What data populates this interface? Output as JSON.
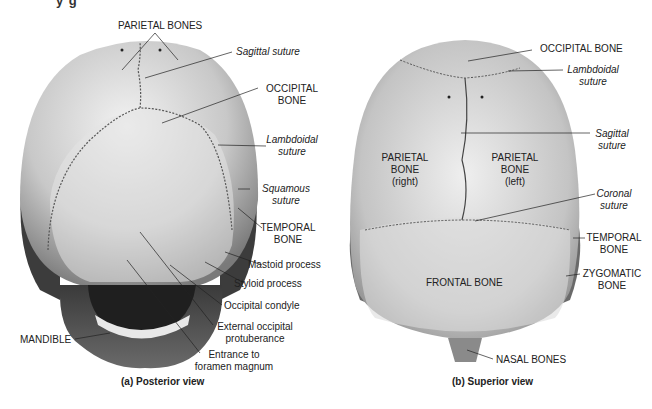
{
  "figure": {
    "clipped_heading": "y g",
    "colors": {
      "bone_light": "#ececec",
      "bone_mid": "#b4b4b4",
      "bone_dark": "#5a5a5a",
      "temporal_dark": "#3c3c3c",
      "suture": "#555555",
      "leader": "#222222"
    }
  },
  "posterior": {
    "caption": "(a) Posterior view",
    "labels": {
      "parietal_bones": "PARIETAL BONES",
      "sagittal_suture": "Sagittal suture",
      "occipital_bone_1": "OCCIPITAL",
      "occipital_bone_2": "BONE",
      "lambdoidal_1": "Lambdoidal",
      "lambdoidal_2": "suture",
      "squamous_1": "Squamous",
      "squamous_2": "suture",
      "temporal_1": "TEMPORAL",
      "temporal_2": "BONE",
      "mastoid": "Mastoid process",
      "styloid": "Styloid process",
      "condyle": "Occipital condyle",
      "ext_occ_1": "External occipital",
      "ext_occ_2": "protuberance",
      "foramen_1": "Entrance to",
      "foramen_2": "foramen magnum",
      "mandible": "MANDIBLE"
    }
  },
  "superior": {
    "caption": "(b) Superior view",
    "labels": {
      "occipital_bone": "OCCIPITAL BONE",
      "lambdoidal_1": "Lambdoidal",
      "lambdoidal_2": "suture",
      "sagittal_1": "Sagittal",
      "sagittal_2": "suture",
      "parietal_right_1": "PARIETAL",
      "parietal_right_2": "BONE",
      "parietal_right_3": "(right)",
      "parietal_left_1": "PARIETAL",
      "parietal_left_2": "BONE",
      "parietal_left_3": "(left)",
      "coronal_1": "Coronal",
      "coronal_2": "suture",
      "temporal_1": "TEMPORAL",
      "temporal_2": "BONE",
      "zygomatic_1": "ZYGOMATIC",
      "zygomatic_2": "BONE",
      "frontal": "FRONTAL BONE",
      "nasal": "NASAL BONES"
    }
  }
}
